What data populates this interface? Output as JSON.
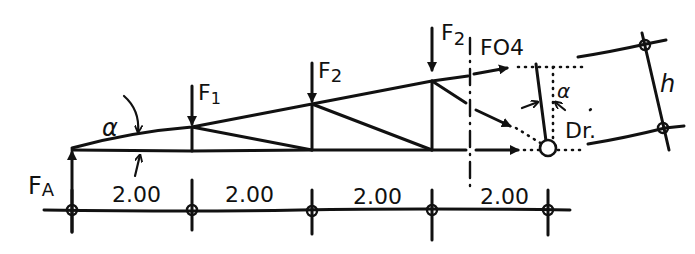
{
  "diagram": {
    "type": "truss-section-method",
    "style": "hand-drawn",
    "colors": {
      "ink": "#111111",
      "background": "#ffffff"
    },
    "labels": {
      "support_reaction": "F",
      "support_reaction_sub": "A",
      "load_1": "F",
      "load_1_sub": "1",
      "load_2a": "F",
      "load_2a_sub": "2",
      "load_2b": "F",
      "load_2b_sub": "2",
      "top_chord_force": "FO4",
      "angle_left": "α",
      "angle_right": "α",
      "pivot_point": "Dr.",
      "height": "h"
    },
    "dimensions": {
      "spans": [
        "2.00",
        "2.00",
        "2.00",
        "2.00"
      ]
    },
    "nodes": {
      "support_left": "A",
      "pivot": "Dr."
    }
  }
}
